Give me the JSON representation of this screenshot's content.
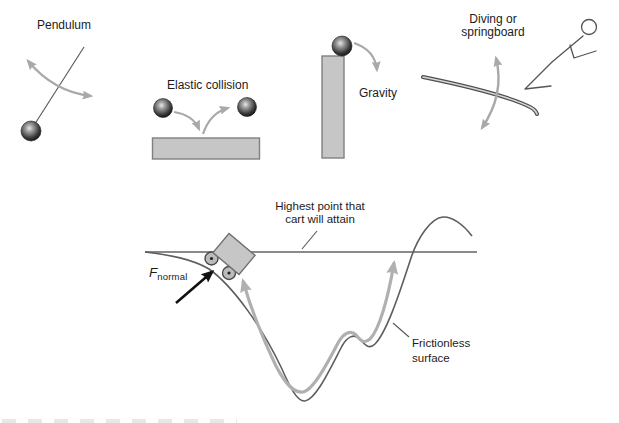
{
  "colors": {
    "background": "#ffffff",
    "text": "#1c1c1c",
    "arrow_gray": "#a9a9a9",
    "path_gray": "#b0b0b0",
    "track_gray": "#5e5e5e",
    "reference_line_gray": "#8a8a8a",
    "shape_fill": "#c6c6c6",
    "shape_border": "#808080",
    "force_black": "#111111"
  },
  "pendulum": {
    "label": "Pendulum"
  },
  "elastic_collision": {
    "label": "Elastic collision"
  },
  "gravity": {
    "label": "Gravity"
  },
  "diving": {
    "label_line1": "Diving or",
    "label_line2": "springboard"
  },
  "cart_diagram": {
    "highest_line1": "Highest point that",
    "highest_line2": "cart will attain",
    "force_symbol": "F",
    "force_subscript": "normal",
    "surface_line1": "Frictionless",
    "surface_line2": "surface"
  }
}
